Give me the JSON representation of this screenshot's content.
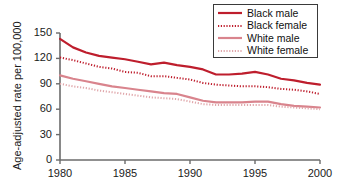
{
  "chart_data": {
    "type": "line",
    "title": "",
    "xlabel": "",
    "ylabel": "Age-adjusted rate per 100,000",
    "xlim": [
      1980,
      2000
    ],
    "ylim": [
      0,
      150
    ],
    "grid": false,
    "legend_position": "top-right",
    "xticks": [
      "1980",
      "1985",
      "1990",
      "1995",
      "2000"
    ],
    "yticks": [
      "0",
      "30",
      "60",
      "90",
      "120",
      "150"
    ],
    "x": [
      1980,
      1981,
      1982,
      1983,
      1984,
      1985,
      1986,
      1987,
      1988,
      1989,
      1990,
      1991,
      1992,
      1993,
      1994,
      1995,
      1996,
      1997,
      1998,
      1999,
      2000
    ],
    "series": [
      {
        "name": "Black male",
        "color": "#be1e2d",
        "style": "solid",
        "values": [
          143,
          133,
          127,
          123,
          121,
          119,
          116,
          113,
          115,
          112,
          110,
          107,
          101,
          101,
          102,
          104,
          101,
          96,
          94,
          91,
          89
        ]
      },
      {
        "name": "Black female",
        "color": "#be1e2d",
        "style": "dotted",
        "values": [
          121,
          118,
          114,
          110,
          108,
          104,
          103,
          99,
          99,
          97,
          95,
          91,
          89,
          88,
          87,
          87,
          86,
          84,
          83,
          81,
          78
        ]
      },
      {
        "name": "White male",
        "color": "#d9848d",
        "style": "solid",
        "values": [
          100,
          96,
          93,
          90,
          87,
          85,
          83,
          81,
          79,
          78,
          74,
          70,
          68,
          68,
          68,
          69,
          69,
          66,
          64,
          63,
          62
        ]
      },
      {
        "name": "White female",
        "color": "#e0a7ab",
        "style": "dotted",
        "values": [
          90,
          87,
          85,
          82,
          80,
          78,
          76,
          74,
          73,
          72,
          69,
          66,
          65,
          65,
          65,
          65,
          65,
          63,
          62,
          61,
          60
        ]
      }
    ]
  },
  "legend": {
    "items": [
      {
        "label": "Black male",
        "color": "#be1e2d",
        "style": "solid"
      },
      {
        "label": "Black female",
        "color": "#be1e2d",
        "style": "dotted"
      },
      {
        "label": "White male",
        "color": "#d9848d",
        "style": "solid"
      },
      {
        "label": "White female",
        "color": "#e0a7ab",
        "style": "dotted"
      }
    ]
  },
  "axes": {
    "y_title": "Age-adjusted rate per 100,000",
    "y_ticks": [
      "150",
      "120",
      "90",
      "60",
      "30",
      "0"
    ],
    "x_ticks": [
      "1980",
      "1985",
      "1990",
      "1995",
      "2000"
    ],
    "axis_color": "#6b6b6b"
  }
}
